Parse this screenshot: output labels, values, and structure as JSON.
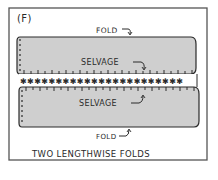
{
  "figure": {
    "panel_label": "(F)",
    "caption": "TWO LENGTHWISE FOLDS",
    "labels": {
      "top_fold": "FOLD",
      "top_selvage": "SELVAGE",
      "bottom_selvage": "SELVAGE",
      "bottom_fold": "FOLD"
    },
    "colors": {
      "fabric_fill": "#cfcfcf",
      "ink": "#2a2a2a",
      "frame": "#555555",
      "background": "#ffffff"
    },
    "selvage_row_marks": "✱✱✱✱✱✱✱✱✱✱✱✱✱✱✱✱✱✱✱✱✱✱✱"
  }
}
